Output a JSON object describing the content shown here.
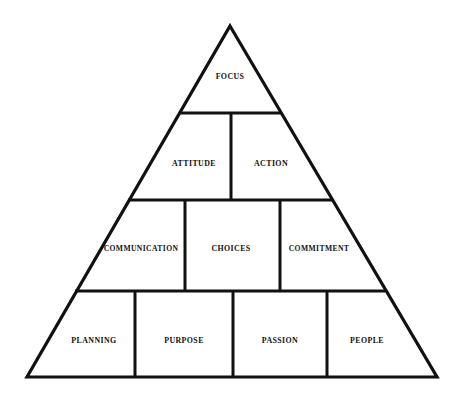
{
  "diagram": {
    "type": "pyramid",
    "shape": "triangle",
    "background_color": "#ffffff",
    "stroke_color": "#111111",
    "text_color": "#111111",
    "apex": {
      "x": 230,
      "y": 26
    },
    "base_left": {
      "x": 27,
      "y": 377
    },
    "base_right": {
      "x": 437,
      "y": 377
    },
    "tier_divider_y": [
      113,
      200,
      291
    ],
    "tiers": [
      {
        "level": 1,
        "name": "apex-tier",
        "cells": [
          {
            "label": "FOCUS",
            "cx": 230,
            "cy": 77,
            "size": "md"
          }
        ]
      },
      {
        "level": 2,
        "name": "second-tier",
        "cells": [
          {
            "label": "ATTITUDE",
            "cx": 194,
            "cy": 164,
            "size": "md"
          },
          {
            "label": "ACTION",
            "cx": 271,
            "cy": 164,
            "size": "md"
          }
        ]
      },
      {
        "level": 3,
        "name": "third-tier",
        "cells": [
          {
            "label": "COMMUNICATION",
            "cx": 141,
            "cy": 249,
            "size": "sm"
          },
          {
            "label": "CHOICES",
            "cx": 231,
            "cy": 249,
            "size": "md"
          },
          {
            "label": "COMMITMENT",
            "cx": 319,
            "cy": 249,
            "size": "sm"
          }
        ]
      },
      {
        "level": 4,
        "name": "base-tier",
        "cells": [
          {
            "label": "PLANNING",
            "cx": 94,
            "cy": 341,
            "size": "md"
          },
          {
            "label": "PURPOSE",
            "cx": 184,
            "cy": 341,
            "size": "md"
          },
          {
            "label": "PASSION",
            "cx": 280,
            "cy": 341,
            "size": "md"
          },
          {
            "label": "PEOPLE",
            "cx": 367,
            "cy": 341,
            "size": "md"
          }
        ]
      }
    ],
    "geometry": {
      "outline_path": "M 230 26 L 437 377 L 27 377 Z",
      "divider_lines": [
        {
          "name": "tier1-tier2-divider",
          "x1": 179,
          "y1": 113,
          "x2": 281,
          "y2": 113
        },
        {
          "name": "tier2-tier3-divider",
          "x1": 128,
          "y1": 200,
          "x2": 332,
          "y2": 200
        },
        {
          "name": "tier3-tier4-divider",
          "x1": 75,
          "y1": 291,
          "x2": 385,
          "y2": 291
        },
        {
          "name": "attitude-action-divider",
          "x1": 231,
          "y1": 113,
          "x2": 231,
          "y2": 200
        },
        {
          "name": "communication-choices-divider",
          "x1": 185,
          "y1": 200,
          "x2": 185,
          "y2": 291
        },
        {
          "name": "choices-commitment-divider",
          "x1": 280,
          "y1": 200,
          "x2": 280,
          "y2": 291
        },
        {
          "name": "planning-purpose-divider",
          "x1": 135,
          "y1": 291,
          "x2": 135,
          "y2": 377
        },
        {
          "name": "purpose-passion-divider",
          "x1": 233,
          "y1": 291,
          "x2": 233,
          "y2": 377
        },
        {
          "name": "passion-people-divider",
          "x1": 327,
          "y1": 291,
          "x2": 327,
          "y2": 377
        }
      ]
    }
  }
}
